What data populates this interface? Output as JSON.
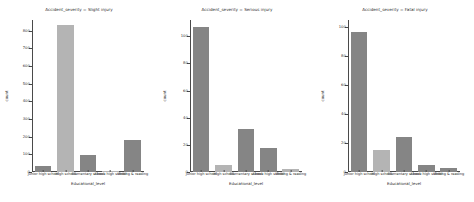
{
  "chart_data": {
    "type": "bar",
    "title": "",
    "figure_kind": "faceted-countplot",
    "xlabel": "Educational_level",
    "ylabel": "count",
    "grid": false,
    "legend": null,
    "categories": [
      "Junior high school",
      "High school",
      "Elementary school",
      "Above high school",
      "Writing & reading"
    ],
    "panels": [
      {
        "title": "Accident_severity = Slight injury",
        "facet_value": "Slight injury",
        "ylim": [
          0,
          860
        ],
        "yticks": [
          0,
          100,
          200,
          300,
          400,
          500,
          600,
          700,
          800
        ],
        "ytick_labels": [
          "0",
          "100",
          "200",
          "300",
          "400",
          "500",
          "600",
          "700",
          "800"
        ],
        "values": [
          35,
          830,
          95,
          6,
          180
        ],
        "colors": [
          "#858585",
          "#b4b4b4",
          "#858585",
          "#b4b4b4",
          "#858585"
        ]
      },
      {
        "title": "Accident_severity = Serious injury",
        "facet_value": "Serious injury",
        "ylim": [
          0,
          112
        ],
        "yticks": [
          0,
          20,
          40,
          60,
          80,
          100
        ],
        "ytick_labels": [
          "0",
          "20",
          "40",
          "60",
          "80",
          "100"
        ],
        "values": [
          107,
          5,
          32,
          18,
          2
        ],
        "colors": [
          "#858585",
          "#b4b4b4",
          "#858585",
          "#858585",
          "#b4b4b4"
        ]
      },
      {
        "title": "Accident_severity = Fatal injury",
        "facet_value": "Fatal injury",
        "ylim": [
          0,
          105
        ],
        "yticks": [
          0,
          20,
          40,
          60,
          80,
          100
        ],
        "ytick_labels": [
          "0",
          "20",
          "40",
          "60",
          "80",
          "100"
        ],
        "values": [
          97,
          15,
          24,
          5,
          3
        ],
        "colors": [
          "#858585",
          "#b4b4b4",
          "#858585",
          "#858585",
          "#858585"
        ]
      }
    ]
  }
}
